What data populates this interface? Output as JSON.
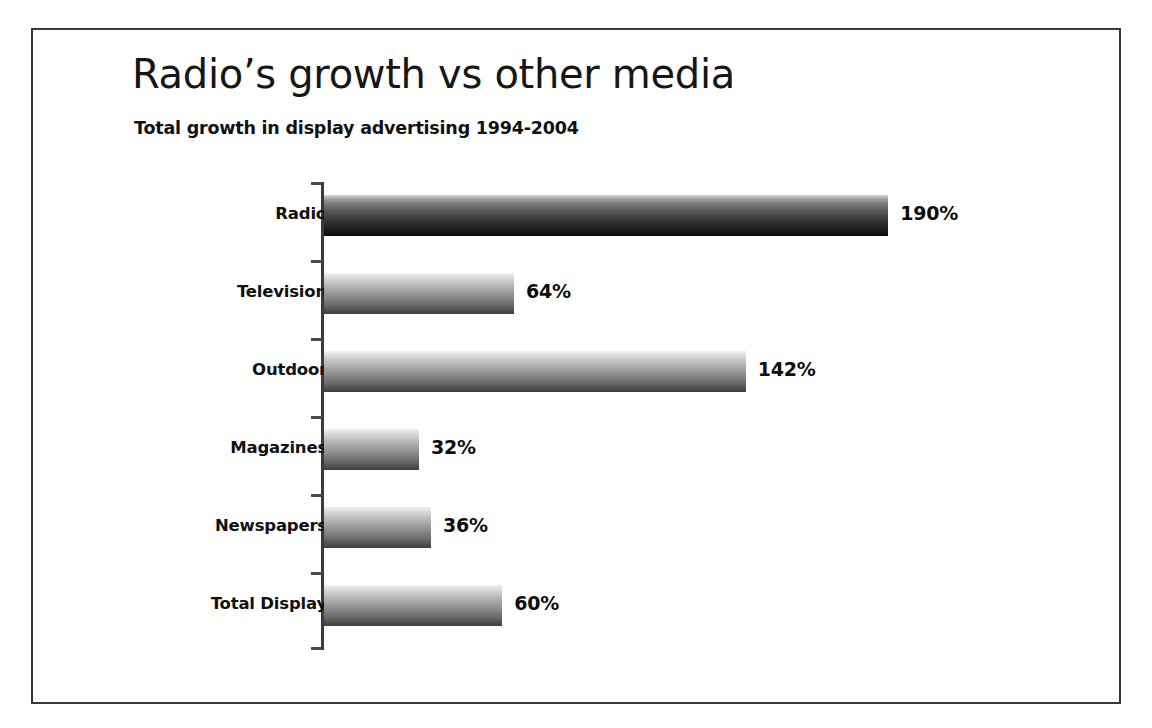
{
  "chart_data": {
    "type": "bar",
    "orientation": "horizontal",
    "title": "Radio’s growth vs other media",
    "subtitle": "Total growth in display advertising 1994-2004",
    "xlabel": "",
    "ylabel": "",
    "categories": [
      "Radio",
      "Television",
      "Outdoor",
      "Magazines",
      "Newspapers",
      "Total Display"
    ],
    "values": [
      190,
      64,
      142,
      32,
      36,
      60
    ],
    "value_labels": [
      "190%",
      "64%",
      "142%",
      "32%",
      "36%",
      "60%"
    ],
    "unit": "%",
    "xlim": [
      0,
      200
    ],
    "grid": false,
    "legend": null,
    "axis_ticks_visible": true,
    "bar_style": "vertical-gradient-light-to-dark",
    "series": [
      {
        "name": "Total growth in display advertising 1994-2004",
        "points": [
          {
            "category": "Radio",
            "value": 190,
            "label": "190%",
            "emphasis": true
          },
          {
            "category": "Television",
            "value": 64,
            "label": "64%",
            "emphasis": false
          },
          {
            "category": "Outdoor",
            "value": 142,
            "label": "142%",
            "emphasis": false
          },
          {
            "category": "Magazines",
            "value": 32,
            "label": "32%",
            "emphasis": false
          },
          {
            "category": "Newspapers",
            "value": 36,
            "label": "36%",
            "emphasis": false
          },
          {
            "category": "Total Display",
            "value": 60,
            "label": "60%",
            "emphasis": false
          }
        ]
      }
    ]
  },
  "colors": {
    "frame_border": "#3a3a3c",
    "axis": "#3b3b3d",
    "text": "#111111",
    "background": "#ffffff",
    "bar_light": "#f2f2f2",
    "bar_dark": "#0d0d0d"
  }
}
